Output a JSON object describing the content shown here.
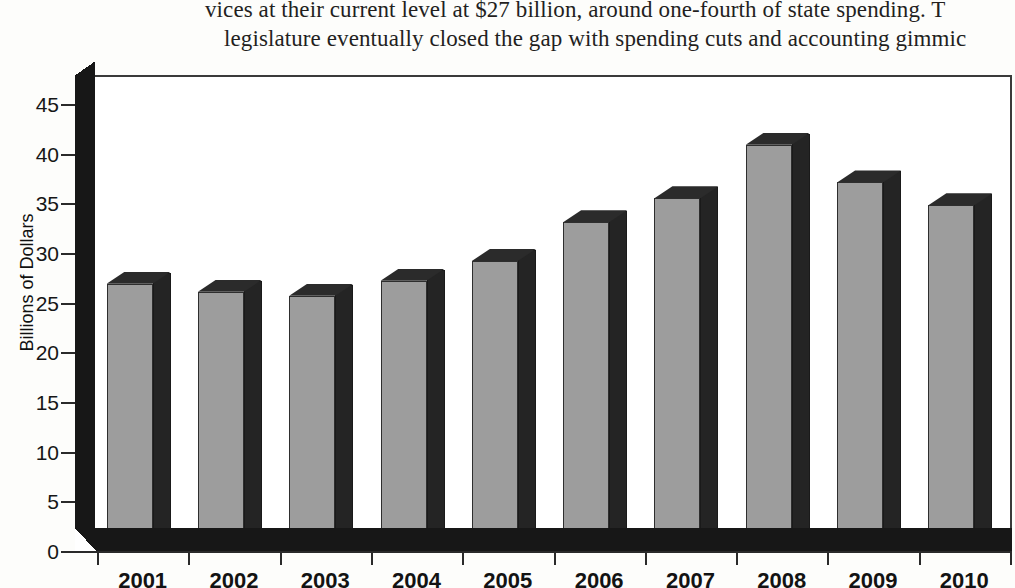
{
  "page_text": {
    "line1": "vices at their current level at $27 billion, around one-fourth of state spending. T",
    "line2": "legislature eventually closed the gap with spending cuts and accounting gimmic"
  },
  "chart_data": {
    "type": "bar",
    "title": "",
    "xlabel": "",
    "ylabel": "Billions of Dollars",
    "categories": [
      "2001",
      "2002",
      "2003",
      "2004",
      "2005",
      "2006",
      "2007",
      "2008",
      "2009",
      "2010"
    ],
    "values": [
      27.0,
      26.2,
      25.8,
      27.3,
      29.3,
      33.2,
      35.6,
      41.0,
      37.2,
      34.9
    ],
    "ylim": [
      0,
      45
    ],
    "ytick_values": [
      0,
      5,
      10,
      15,
      20,
      25,
      30,
      35,
      40,
      45
    ],
    "ytick_labels": [
      "0",
      "5",
      "10",
      "15",
      "20",
      "25",
      "30",
      "35",
      "40",
      "45"
    ],
    "grid": false,
    "legend": "none",
    "style": "3d-column",
    "bar_face_color": "#9d9d9d",
    "bar_shade_color": "#242424",
    "plot_background": "#ffffff",
    "axis_color": "#2a2a2a"
  }
}
